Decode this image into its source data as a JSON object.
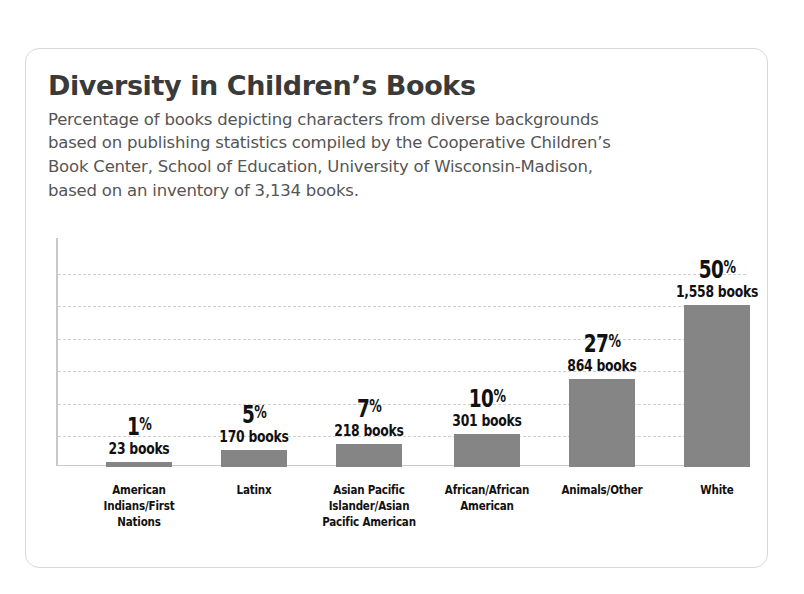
{
  "card": {
    "title": "Diversity in Children’s Books",
    "subtitle": "Percentage of books depicting characters from diverse backgrounds\nbased on publishing statistics compiled by the Cooperative Children’s\nBook Center, School of Education, University of Wisconsin-Madison,\nbased on an inventory of 3,134 books."
  },
  "colors": {
    "bar": "#858585",
    "title": "#3a3a3a",
    "subtitle": "#555555",
    "gridline": "#cfcfcf",
    "axis": "#c9c9c9",
    "card_border": "#d8d8d8",
    "background": "#ffffff"
  },
  "chart_data": {
    "type": "bar",
    "title": "Diversity in Children’s Books",
    "subtitle": "Percentage of books depicting characters from diverse backgrounds based on publishing statistics compiled by the Cooperative Children’s Book Center, School of Education, University of Wisconsin-Madison, based on an inventory of 3,134 books.",
    "xlabel": "",
    "ylabel": "",
    "ylim": [
      0,
      70
    ],
    "grid": true,
    "legend": "none",
    "total_books": "3,134",
    "categories": [
      "American\nIndians/First\nNations",
      "Latinx",
      "Asian Pacific\nIslander/Asian\nPacific American",
      "African/African\nAmerican",
      "Animals/Other",
      "White"
    ],
    "values": [
      1,
      5,
      7,
      10,
      27,
      50
    ],
    "bars": [
      {
        "category": "American\nIndians/First\nNations",
        "percent": 1,
        "percent_label": "1",
        "percent_symbol": "%",
        "count_label": "23 books",
        "count": 23
      },
      {
        "category": "Latinx",
        "percent": 5,
        "percent_label": "5",
        "percent_symbol": "%",
        "count_label": "170 books",
        "count": 170
      },
      {
        "category": "Asian Pacific\nIslander/Asian\nPacific American",
        "percent": 7,
        "percent_label": "7",
        "percent_symbol": "%",
        "count_label": "218 books",
        "count": 218
      },
      {
        "category": "African/African\nAmerican",
        "percent": 10,
        "percent_label": "10",
        "percent_symbol": "%",
        "count_label": "301 books",
        "count": 301
      },
      {
        "category": "Animals/Other",
        "percent": 27,
        "percent_label": "27",
        "percent_symbol": "%",
        "count_label": "864 books",
        "count": 864
      },
      {
        "category": "White",
        "percent": 50,
        "percent_label": "50",
        "percent_symbol": "%",
        "count_label": "1,558 books",
        "count": 1558
      }
    ]
  }
}
